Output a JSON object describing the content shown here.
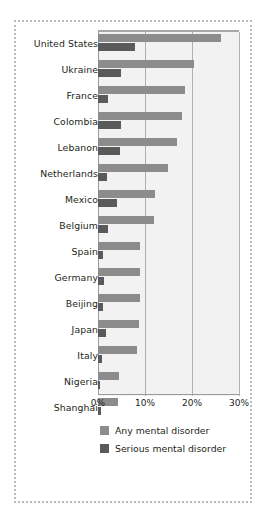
{
  "chart_data": {
    "type": "bar",
    "orientation": "horizontal",
    "title": "",
    "xlabel": "",
    "ylabel": "",
    "xlim": [
      0,
      30
    ],
    "xunit": "%",
    "grid": true,
    "legend_position": "bottom-left",
    "xticks": [
      "0%",
      "10%",
      "20%",
      "30%"
    ],
    "xtick_values": [
      0,
      10,
      20,
      30
    ],
    "categories": [
      "United States",
      "Ukraine",
      "France",
      "Colombia",
      "Lebanon",
      "Netherlands",
      "Mexico",
      "Belgium",
      "Spain",
      "Germany",
      "Beijing",
      "Japan",
      "Italy",
      "Nigeria",
      "Shanghai"
    ],
    "series": [
      {
        "name": "Any mental disorder",
        "color": "#8c8c8c",
        "values": [
          26.2,
          20.4,
          18.5,
          17.8,
          16.8,
          14.9,
          12.2,
          11.9,
          9.0,
          8.9,
          9.0,
          8.7,
          8.2,
          4.4,
          4.3
        ]
      },
      {
        "name": "Serious mental disorder",
        "color": "#5a5a5a",
        "values": [
          7.9,
          4.8,
          2.1,
          4.9,
          4.6,
          1.9,
          4.0,
          2.1,
          1.0,
          1.2,
          1.0,
          1.6,
          0.8,
          0.4,
          0.7
        ]
      }
    ]
  },
  "legend": {
    "items": [
      {
        "label": "Any mental disorder"
      },
      {
        "label": "Serious mental disorder"
      }
    ]
  }
}
